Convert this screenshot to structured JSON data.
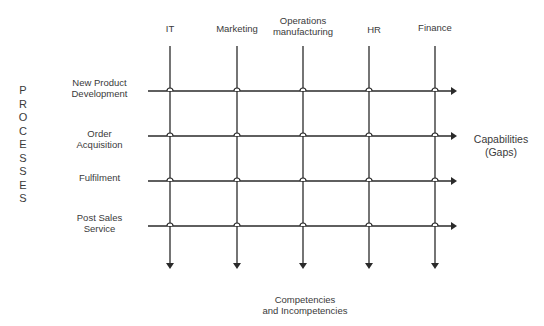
{
  "side_label": [
    "P",
    "R",
    "O",
    "C",
    "E",
    "S",
    "S",
    "E",
    "S"
  ],
  "columns": [
    {
      "label": "IT",
      "x": 170
    },
    {
      "label": "Marketing",
      "x": 237
    },
    {
      "label": "Operations\nmanufacturing",
      "x": 303
    },
    {
      "label": "HR",
      "x": 369
    },
    {
      "label": "Finance",
      "x": 435
    }
  ],
  "rows": [
    {
      "label": "New Product\nDevelopment",
      "y": 91
    },
    {
      "label": "Order\nAcquisition",
      "y": 136
    },
    {
      "label": "Fulfilment",
      "y": 181
    },
    {
      "label": "Post Sales\nService",
      "y": 226
    }
  ],
  "right_label": "Capabilities\n(Gaps)",
  "bottom_label": "Competencies\nand Incompetencies",
  "line_color": "#2a2a2a"
}
